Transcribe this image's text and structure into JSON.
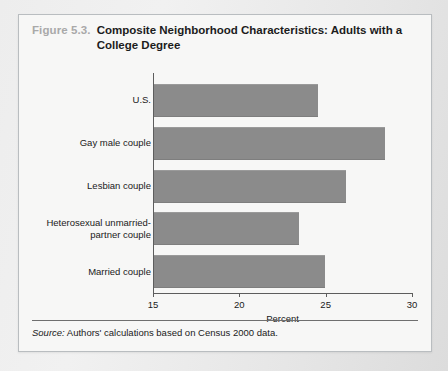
{
  "figure": {
    "number_label": "Figure 5.3.",
    "title": "Composite Neighborhood Characteristics: Adults with a College Degree",
    "source_word": "Source:",
    "source_text": " Authors' calculations based on Census 2000 data."
  },
  "colors": {
    "bar": "#8b8b8b",
    "axis": "#5d5d5d",
    "panel": "#f7f7f6",
    "page": "#e9e9e9",
    "figure_number": "#a9a9a9",
    "text": "#1a1a1a"
  },
  "chart_data": {
    "type": "bar",
    "orientation": "horizontal",
    "title": "Composite Neighborhood Characteristics: Adults with a College Degree",
    "categories": [
      "U.S.",
      "Gay male couple",
      "Lesbian couple",
      "Heterosexual unmarried-partner couple",
      "Married couple"
    ],
    "values": [
      24.5,
      28.4,
      26.1,
      23.4,
      24.9
    ],
    "xlabel": "Percent",
    "ylabel": "",
    "xlim": [
      15,
      30
    ],
    "xticks": [
      15,
      20,
      25,
      30
    ],
    "xtick_labels": [
      "15",
      "20",
      "25",
      "30"
    ],
    "grid": false,
    "legend": false
  }
}
